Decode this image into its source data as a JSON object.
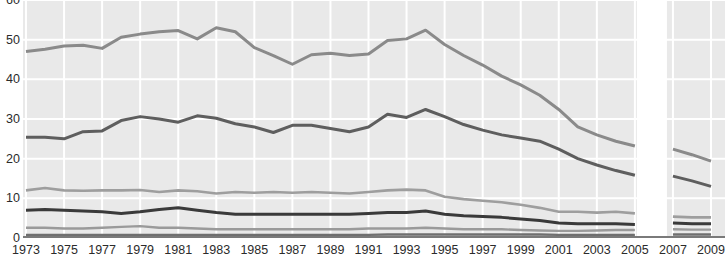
{
  "chart_data": {
    "type": "line",
    "title": "",
    "subtitle": "",
    "xlabel": "",
    "ylabel": "",
    "grid": true,
    "legend_position": "none",
    "xlim": [
      1973,
      2009
    ],
    "ylim": [
      0,
      60
    ],
    "y_ticks": [
      0,
      10,
      20,
      30,
      40,
      50,
      60
    ],
    "y_tick_labels": [
      "0",
      "10",
      "20",
      "30",
      "40",
      "50",
      "60"
    ],
    "x_ticks": [
      1973,
      1975,
      1977,
      1979,
      1981,
      1983,
      1985,
      1987,
      1989,
      1991,
      1993,
      1995,
      1997,
      1999,
      2001,
      2003,
      2005,
      2007,
      2009
    ],
    "x_tick_labels": [
      "1973",
      "1975",
      "1977",
      "1979",
      "1981",
      "1983",
      "1985",
      "1987",
      "1989",
      "1991",
      "1993",
      "1995",
      "1997",
      "1999",
      "2001",
      "2003",
      "2005",
      "2007",
      "2009"
    ],
    "x": [
      1973,
      1974,
      1975,
      1976,
      1977,
      1978,
      1979,
      1980,
      1981,
      1982,
      1983,
      1984,
      1985,
      1986,
      1987,
      1988,
      1989,
      1990,
      1991,
      1992,
      1993,
      1994,
      1995,
      1996,
      1997,
      1998,
      1999,
      2000,
      2001,
      2002,
      2003,
      2004,
      2005
    ],
    "x_segment_2": [
      2006,
      2007,
      2008,
      2009
    ],
    "data_break": {
      "present": true,
      "between": [
        2005,
        2006
      ],
      "note": "blank vertical band separating the 1973-2005 series from the 2006-2009 series"
    },
    "series": [
      {
        "name": "series-1",
        "color": "#8a8a8a",
        "width": 3.0,
        "values": [
          47.0,
          47.6,
          48.4,
          48.6,
          47.8,
          50.6,
          51.4,
          52.0,
          52.3,
          50.2,
          53.0,
          52.0,
          48.0,
          46.0,
          43.8,
          46.2,
          46.6,
          46.0,
          46.4,
          49.8,
          50.2,
          52.4,
          48.8,
          46.0,
          43.6,
          40.8,
          38.6,
          36.0,
          32.4,
          28.0,
          26.0,
          24.4,
          23.2
        ],
        "values_segment_2": [
          null,
          22.4,
          21.0,
          19.4
        ]
      },
      {
        "name": "series-2",
        "color": "#5e5e5e",
        "width": 3.0,
        "values": [
          25.4,
          25.4,
          25.0,
          26.8,
          27.0,
          29.6,
          30.6,
          30.0,
          29.2,
          30.8,
          30.2,
          28.8,
          28.0,
          26.6,
          28.4,
          28.4,
          27.6,
          26.8,
          28.0,
          31.2,
          30.4,
          32.4,
          30.6,
          28.6,
          27.2,
          26.0,
          25.2,
          24.4,
          22.4,
          20.0,
          18.4,
          17.0,
          15.8
        ],
        "values_segment_2": [
          null,
          15.6,
          14.4,
          13.0
        ]
      },
      {
        "name": "series-3",
        "color": "#9e9e9e",
        "width": 2.6,
        "values": [
          12.0,
          12.6,
          12.0,
          11.9,
          12.0,
          12.0,
          12.1,
          11.6,
          12.0,
          11.8,
          11.2,
          11.6,
          11.4,
          11.6,
          11.4,
          11.6,
          11.4,
          11.2,
          11.6,
          12.0,
          12.2,
          12.0,
          10.4,
          9.8,
          9.4,
          9.0,
          8.4,
          7.6,
          6.6,
          6.6,
          6.4,
          6.6,
          6.2
        ],
        "values_segment_2": [
          null,
          5.4,
          5.2,
          5.2
        ]
      },
      {
        "name": "series-4",
        "color": "#3a3a3a",
        "width": 3.0,
        "values": [
          7.0,
          7.2,
          7.0,
          6.8,
          6.6,
          6.2,
          6.6,
          7.2,
          7.6,
          7.0,
          6.4,
          6.0,
          6.0,
          6.0,
          6.0,
          6.0,
          6.0,
          6.0,
          6.2,
          6.4,
          6.4,
          6.8,
          6.0,
          5.6,
          5.4,
          5.2,
          4.8,
          4.4,
          3.8,
          3.6,
          3.6,
          3.6,
          3.4
        ],
        "values_segment_2": [
          null,
          3.8,
          3.6,
          3.6
        ]
      },
      {
        "name": "series-5",
        "color": "#9a9a9a",
        "width": 2.4,
        "values": [
          2.6,
          2.6,
          2.4,
          2.4,
          2.6,
          2.8,
          3.0,
          2.6,
          2.6,
          2.4,
          2.2,
          2.2,
          2.2,
          2.2,
          2.2,
          2.2,
          2.2,
          2.2,
          2.4,
          2.4,
          2.4,
          2.6,
          2.4,
          2.2,
          2.2,
          2.2,
          2.0,
          1.9,
          1.8,
          1.8,
          1.9,
          2.0,
          2.0
        ],
        "values_segment_2": [
          null,
          2.2,
          2.1,
          2.1
        ]
      },
      {
        "name": "series-6",
        "color": "#6f6f6f",
        "width": 2.4,
        "values": [
          0.8,
          0.8,
          0.8,
          0.8,
          0.8,
          0.8,
          0.8,
          0.8,
          0.8,
          0.8,
          0.8,
          0.8,
          0.8,
          0.8,
          0.8,
          0.8,
          0.8,
          0.8,
          0.8,
          0.9,
          0.9,
          0.9,
          0.9,
          0.9,
          0.9,
          0.9,
          0.9,
          0.9,
          0.8,
          0.8,
          0.8,
          0.8,
          0.8
        ],
        "values_segment_2": [
          null,
          0.9,
          0.9,
          0.9
        ]
      }
    ]
  },
  "axes": {
    "background_color": "#e9e9e9",
    "gridline_color": "#ffffff",
    "tick_text_color": "#2b2b2b"
  },
  "caption": {
    "fragment": ""
  }
}
